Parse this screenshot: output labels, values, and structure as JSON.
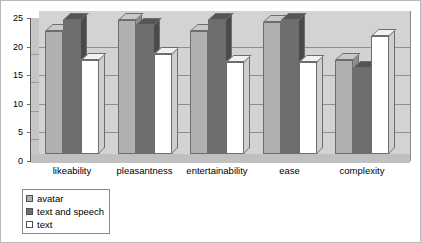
{
  "chart_data": {
    "type": "bar",
    "title": "",
    "xlabel": "",
    "ylabel": "",
    "ylim": [
      0,
      25
    ],
    "yticks": [
      0,
      5,
      10,
      15,
      20,
      25
    ],
    "grid": true,
    "legend_position": "bottom-left",
    "three_d": true,
    "categories": [
      "likeability",
      "pleasantness",
      "entertainability",
      "ease",
      "complexity"
    ],
    "series": [
      {
        "name": "avatar",
        "color": "#b0b0b0",
        "values": [
          21.5,
          23.5,
          21.5,
          23.0,
          16.5
        ]
      },
      {
        "name": "text and speech",
        "color": "#6e6e6e",
        "values": [
          23.5,
          22.5,
          23.5,
          23.5,
          15.0
        ]
      },
      {
        "name": "text",
        "color": "#ffffff",
        "values": [
          16.5,
          17.5,
          16.0,
          16.0,
          20.7
        ]
      }
    ]
  },
  "axis": {
    "tick_labels": [
      "25",
      "20",
      "15",
      "10",
      "5",
      "0"
    ]
  },
  "legend": {
    "items": [
      {
        "label": "avatar"
      },
      {
        "label": "text and speech"
      },
      {
        "label": "text"
      }
    ]
  }
}
